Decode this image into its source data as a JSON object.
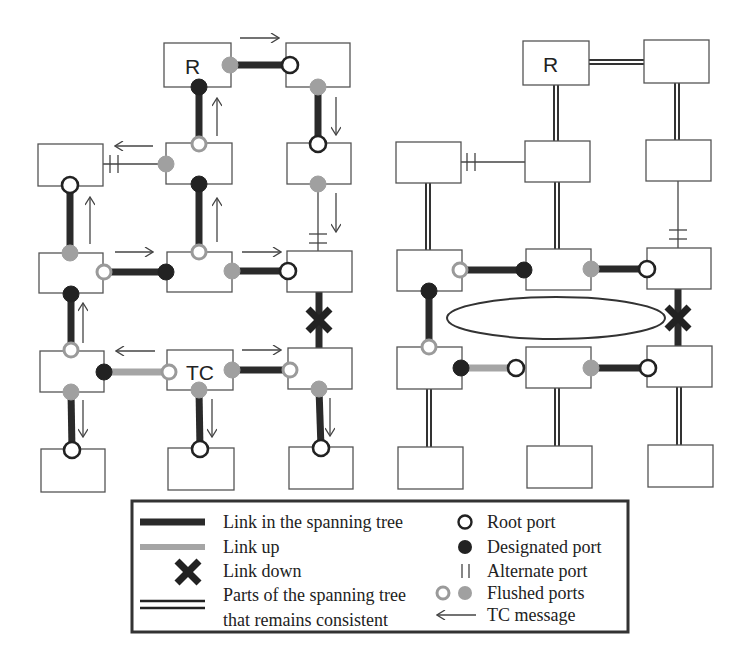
{
  "figure": {
    "left_panel": {
      "root_label": "R",
      "tc_label": "TC"
    },
    "right_panel": {
      "root_label": "R"
    }
  },
  "legend": {
    "left_items": [
      {
        "symbol": "thick-dark-line",
        "label": "Link in the spanning tree"
      },
      {
        "symbol": "thick-grey-line",
        "label": "Link up"
      },
      {
        "symbol": "x-mark",
        "label": "Link down"
      },
      {
        "symbol": "double-line",
        "label": "Parts of the spanning tree",
        "label2": "that remains consistent"
      }
    ],
    "right_items": [
      {
        "symbol": "hollow-circle",
        "label": "Root port"
      },
      {
        "symbol": "filled-circle",
        "label": "Designated port"
      },
      {
        "symbol": "double-bar",
        "label": "Alternate port"
      },
      {
        "symbol": "grey-circles",
        "label": "Flushed ports"
      },
      {
        "symbol": "left-arrow",
        "label": "TC message"
      }
    ]
  },
  "colors": {
    "tree_link": "#2a2a2a",
    "link_up": "#a5a5a5",
    "flushed": "#a0a0a0",
    "box_border": "#555555"
  }
}
